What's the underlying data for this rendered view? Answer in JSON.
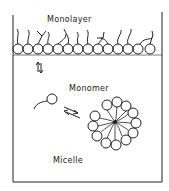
{
  "diagram": {
    "labels": {
      "monolayer": "Monolayer",
      "monomer": "Monomer",
      "micelle": "Micelle"
    },
    "equilibria": [
      {
        "name": "monolayer-monomer",
        "symbol": "⇅"
      },
      {
        "name": "monomer-micelle",
        "symbol": "⇌"
      }
    ],
    "colors": {
      "line": "#222222",
      "background": "#ffffff"
    }
  }
}
